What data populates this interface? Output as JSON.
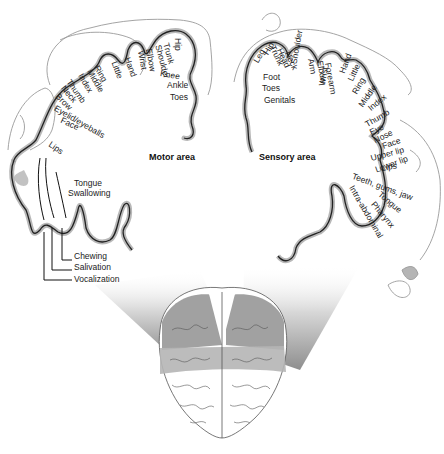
{
  "diagram": {
    "motor": {
      "title": "Motor area",
      "labels": [
        "Hip",
        "Trunk",
        "Shoulder",
        "Elbow",
        "Wrist",
        "Hand",
        "Little",
        "Ring",
        "Middle",
        "Index",
        "Thumb",
        "Neck",
        "Brow",
        "Eyelid/eyeballs",
        "Face",
        "Knee",
        "Ankle",
        "Toes",
        "Lips",
        "Tongue",
        "Swallowing",
        "Chewing",
        "Salivation",
        "Vocalization"
      ]
    },
    "sensory": {
      "title": "Sensory area",
      "labels": [
        "Leg",
        "Hip",
        "Trunk",
        "Head",
        "Neck",
        "Shoulder",
        "Arm",
        "Elbow",
        "Forearm",
        "Wrist",
        "Hand",
        "Little",
        "Ring",
        "Middle",
        "Index",
        "Thumb",
        "Eye",
        "Foot",
        "Toes",
        "Genitals",
        "Nose",
        "Face",
        "Upper lip",
        "Lips",
        "Lower lip",
        "Teeth, gums, jaw",
        "Tongue",
        "Pharynx",
        "Intra-abdominal"
      ]
    },
    "colors": {
      "cortex_outline": "#222222",
      "cortex_fill": "#9a9a9a",
      "figure_line": "#9a9a9a",
      "brain_dark": "#8a8a8a",
      "brain_mid": "#b5b5b5",
      "background": "#ffffff"
    }
  }
}
